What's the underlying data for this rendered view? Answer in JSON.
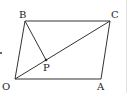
{
  "figure": {
    "type": "parallelogram",
    "colors": {
      "stroke": "#333333",
      "label": "#222222",
      "edge_line": "#dddddd"
    },
    "points": {
      "O": {
        "label": "O",
        "x": 15,
        "y": 79
      },
      "A": {
        "label": "A",
        "x": 101,
        "y": 79
      },
      "C": {
        "label": "C",
        "x": 110,
        "y": 21
      },
      "B": {
        "label": "B",
        "x": 25,
        "y": 21
      },
      "P": {
        "label": "P",
        "x": 46,
        "y": 60
      }
    },
    "segments": [
      [
        "O",
        "A"
      ],
      [
        "A",
        "C"
      ],
      [
        "C",
        "B"
      ],
      [
        "B",
        "O"
      ],
      [
        "O",
        "C"
      ],
      [
        "B",
        "P"
      ]
    ]
  }
}
